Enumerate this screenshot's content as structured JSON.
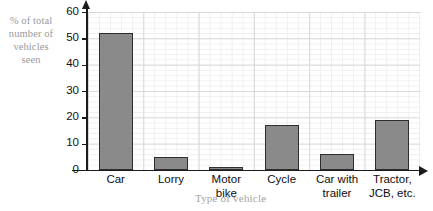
{
  "chart_data": {
    "type": "bar",
    "title": "",
    "subtitle": "",
    "xlabel": "Type of vehicle",
    "ylabel": "% of total number of vehicles seen",
    "categories": [
      "Car",
      "Lorry",
      "Motor bike",
      "Cycle",
      "Car with trailer",
      "Tractor, JCB, etc."
    ],
    "values": [
      52,
      5,
      1,
      17,
      6,
      19
    ],
    "ylim": [
      0,
      60
    ],
    "yticks": [
      0,
      10,
      20,
      30,
      40,
      50,
      60
    ],
    "ytick_labels": [
      "0",
      "10",
      "20",
      "30",
      "40",
      "50",
      "60"
    ],
    "grid": true,
    "legend": "none",
    "bar_color": "#8a8a8a",
    "bar_border_color": "#2e2e2e",
    "axis_color": "#1b1b1b",
    "grid_major_color": "#d8d8dc",
    "grid_minor_color": "#efeff2",
    "axis_title_color": "#9a9a9a",
    "tick_label_color": "#111111"
  },
  "axis": {
    "y_title_line1": "% of total",
    "y_title_line2": "number of",
    "y_title_line3": "vehicles",
    "y_title_line4": "seen",
    "x_title": "Type of vehicle"
  },
  "xlabels": [
    {
      "line1": "Car",
      "line2": ""
    },
    {
      "line1": "Lorry",
      "line2": ""
    },
    {
      "line1": "Motor",
      "line2": "bike"
    },
    {
      "line1": "Cycle",
      "line2": ""
    },
    {
      "line1": "Car with",
      "line2": "trailer"
    },
    {
      "line1": "Tractor,",
      "line2": "JCB, etc."
    }
  ],
  "yticks": [
    {
      "label": "60"
    },
    {
      "label": "50"
    },
    {
      "label": "40"
    },
    {
      "label": "30"
    },
    {
      "label": "20"
    },
    {
      "label": "10"
    },
    {
      "label": "0"
    }
  ]
}
